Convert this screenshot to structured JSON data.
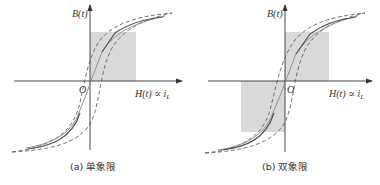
{
  "panels": [
    {
      "id": "a",
      "caption": "(a) 单象限",
      "y_axis_label": "B(t)",
      "x_axis_label": "H(t) ∝ i",
      "x_axis_subscript": "L",
      "origin_label": "O",
      "shaded_quadrants": [
        "I"
      ]
    },
    {
      "id": "b",
      "caption": "(b) 双象限",
      "y_axis_label": "B(t)",
      "x_axis_label": "H(t) ∝ i",
      "x_axis_subscript": "L",
      "origin_label": "O",
      "shaded_quadrants": [
        "I",
        "III"
      ]
    }
  ],
  "colors": {
    "axis": "#333333",
    "curve": "#555555",
    "shade": "#d9d9d9"
  }
}
